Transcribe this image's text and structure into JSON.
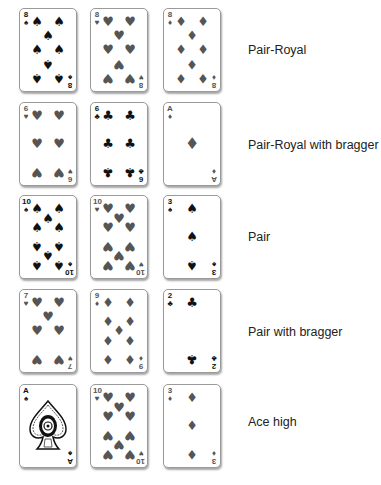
{
  "colors": {
    "black_suit": "#111111",
    "gray_suit": "#555555",
    "card_border": "#9a9a9a",
    "label_text": "#222222"
  },
  "rows": [
    {
      "label": "Pair-Royal",
      "cards": [
        {
          "rank": "8",
          "suit": "spade",
          "glyph": "♠",
          "tone": "black"
        },
        {
          "rank": "8",
          "suit": "heart",
          "glyph": "♥",
          "tone": "gray"
        },
        {
          "rank": "8",
          "suit": "diamond",
          "glyph": "♦",
          "tone": "gray"
        }
      ]
    },
    {
      "label": "Pair-Royal with bragger",
      "cards": [
        {
          "rank": "6",
          "suit": "heart",
          "glyph": "♥",
          "tone": "gray"
        },
        {
          "rank": "6",
          "suit": "club",
          "glyph": "♣",
          "tone": "black"
        },
        {
          "rank": "A",
          "suit": "diamond",
          "glyph": "♦",
          "tone": "gray"
        }
      ]
    },
    {
      "label": "Pair",
      "cards": [
        {
          "rank": "10",
          "suit": "spade",
          "glyph": "♠",
          "tone": "black"
        },
        {
          "rank": "10",
          "suit": "heart",
          "glyph": "♥",
          "tone": "gray"
        },
        {
          "rank": "3",
          "suit": "spade",
          "glyph": "♠",
          "tone": "black"
        }
      ]
    },
    {
      "label": "Pair with bragger",
      "cards": [
        {
          "rank": "7",
          "suit": "heart",
          "glyph": "♥",
          "tone": "gray"
        },
        {
          "rank": "9",
          "suit": "diamond",
          "glyph": "♦",
          "tone": "gray"
        },
        {
          "rank": "2",
          "suit": "club",
          "glyph": "♣",
          "tone": "black"
        }
      ]
    },
    {
      "label": "Ace high",
      "cards": [
        {
          "rank": "A",
          "suit": "spade",
          "glyph": "♠",
          "tone": "black",
          "ornate": true
        },
        {
          "rank": "10",
          "suit": "heart",
          "glyph": "♥",
          "tone": "gray"
        },
        {
          "rank": "3",
          "suit": "diamond",
          "glyph": "♦",
          "tone": "gray"
        }
      ]
    }
  ]
}
